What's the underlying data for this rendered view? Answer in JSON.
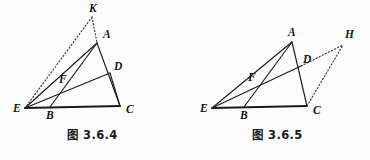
{
  "page": {
    "background_color": "#fdfdfd",
    "ink_color": "#1b1b1b",
    "width": 370,
    "height": 160
  },
  "figures": [
    {
      "id": "figure-3-6-4",
      "caption": "图 3.6.4",
      "points": {
        "A": {
          "x": 97,
          "y": 43,
          "label": "A",
          "label_x": 103,
          "label_y": 38
        },
        "B": {
          "x": 50,
          "y": 107,
          "label": "B",
          "label_x": 46,
          "label_y": 119
        },
        "C": {
          "x": 120,
          "y": 106,
          "label": "C",
          "label_x": 126,
          "label_y": 113
        },
        "D": {
          "x": 110,
          "y": 73,
          "label": "D",
          "label_x": 114,
          "label_y": 70
        },
        "E": {
          "x": 25,
          "y": 108,
          "label": "E",
          "label_x": 13,
          "label_y": 112
        },
        "F": {
          "x": 66,
          "y": 88,
          "label": "F",
          "label_x": 59,
          "label_y": 83
        },
        "K": {
          "x": 92,
          "y": 17,
          "label": "K",
          "label_x": 89,
          "label_y": 12
        }
      },
      "solid_segments": [
        [
          "A",
          "C"
        ],
        [
          "A",
          "B"
        ],
        [
          "A",
          "E"
        ],
        [
          "E",
          "D"
        ],
        [
          "D",
          "C"
        ]
      ],
      "base_segments": [
        [
          "E",
          "C"
        ]
      ],
      "dotted_segments": [
        [
          "K",
          "E"
        ],
        [
          "K",
          "A"
        ]
      ]
    },
    {
      "id": "figure-3-6-5",
      "caption": "图 3.6.5",
      "points": {
        "A": {
          "x": 107,
          "y": 42,
          "label": "A",
          "label_x": 103,
          "label_y": 36
        },
        "B": {
          "x": 59,
          "y": 107,
          "label": "B",
          "label_x": 55,
          "label_y": 119
        },
        "C": {
          "x": 122,
          "y": 106,
          "label": "C",
          "label_x": 128,
          "label_y": 114
        },
        "D": {
          "x": 116,
          "y": 66,
          "label": "D",
          "label_x": 118,
          "label_y": 63
        },
        "E": {
          "x": 27,
          "y": 108,
          "label": "E",
          "label_x": 15,
          "label_y": 112
        },
        "F": {
          "x": 70,
          "y": 86,
          "label": "F",
          "label_x": 63,
          "label_y": 81
        },
        "H": {
          "x": 158,
          "y": 45,
          "label": "H",
          "label_x": 160,
          "label_y": 38
        }
      },
      "solid_segments": [
        [
          "A",
          "C"
        ],
        [
          "A",
          "B"
        ],
        [
          "A",
          "E"
        ],
        [
          "E",
          "D"
        ]
      ],
      "base_segments": [
        [
          "E",
          "C"
        ]
      ],
      "dotted_segments": [
        [
          "D",
          "H"
        ],
        [
          "C",
          "H"
        ]
      ]
    }
  ],
  "chart_data": {
    "type": "diagram",
    "title": "",
    "subtitle": "",
    "panels": [
      {
        "name": "图 3.6.4",
        "vertices": [
          "A",
          "B",
          "C",
          "D",
          "E",
          "F",
          "K"
        ],
        "coordinates": {
          "A": [
            97,
            43
          ],
          "B": [
            50,
            107
          ],
          "C": [
            120,
            106
          ],
          "D": [
            110,
            73
          ],
          "E": [
            25,
            108
          ],
          "F": [
            66,
            88
          ],
          "K": [
            92,
            17
          ]
        },
        "solid_lines": [
          "AC",
          "AB",
          "AE",
          "ED",
          "DC",
          "EC"
        ],
        "dotted_lines": [
          "KE",
          "KA"
        ],
        "intersection_points": [
          {
            "name": "F",
            "of": [
              "AB",
              "ED"
            ]
          },
          {
            "name": "D",
            "of": [
              "ED",
              "AC"
            ]
          },
          {
            "name": "B",
            "of": [
              "AB",
              "EC"
            ]
          }
        ]
      },
      {
        "name": "图 3.6.5",
        "vertices": [
          "A",
          "B",
          "C",
          "D",
          "E",
          "F",
          "H"
        ],
        "coordinates": {
          "A": [
            107,
            42
          ],
          "B": [
            59,
            107
          ],
          "C": [
            122,
            106
          ],
          "D": [
            116,
            66
          ],
          "E": [
            27,
            108
          ],
          "F": [
            70,
            86
          ],
          "H": [
            158,
            45
          ]
        },
        "solid_lines": [
          "AC",
          "AB",
          "AE",
          "ED",
          "EC"
        ],
        "dotted_lines": [
          "DH",
          "CH"
        ],
        "intersection_points": [
          {
            "name": "F",
            "of": [
              "AB",
              "ED"
            ]
          },
          {
            "name": "D",
            "of": [
              "ED",
              "AC"
            ]
          },
          {
            "name": "B",
            "of": [
              "AB",
              "EC"
            ]
          }
        ]
      }
    ]
  }
}
